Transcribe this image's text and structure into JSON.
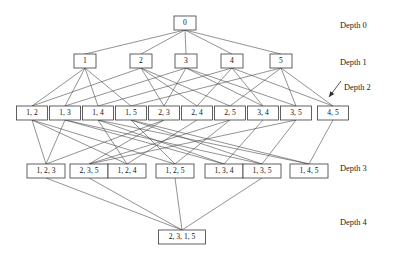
{
  "figure": {
    "type": "lattice-graph",
    "title": "",
    "background_color": "#ffffff",
    "node_fill": "#ffffff",
    "node_stroke": "#3a3a3a",
    "edge_color": "#4a4a4a"
  },
  "depth_labels": [
    {
      "text": "Depth 0",
      "x": 340,
      "y": 26
    },
    {
      "text": "Depth 1",
      "x": 340,
      "y": 63
    },
    {
      "text": "Depth 2",
      "x": 344,
      "y": 88
    },
    {
      "text": "Depth 3",
      "x": 340,
      "y": 169
    },
    {
      "text": "Depth 4",
      "x": 340,
      "y": 223
    }
  ],
  "pointer_arrow": {
    "name": "depth-2-pointer-arrow",
    "from_x": 341,
    "from_y": 81,
    "to_x": 329,
    "to_y": 97
  },
  "levels": [
    {
      "depth": 0,
      "y": 23,
      "nodes": [
        {
          "id": "n0",
          "label": "0",
          "x": 185,
          "w": 22
        }
      ]
    },
    {
      "depth": 1,
      "y": 61,
      "nodes": [
        {
          "id": "n1",
          "label": "1",
          "x": 85,
          "w": 22
        },
        {
          "id": "n2",
          "label": "2",
          "x": 141,
          "w": 22
        },
        {
          "id": "n3",
          "label": "3",
          "x": 186,
          "w": 22
        },
        {
          "id": "n4",
          "label": "4",
          "x": 232,
          "w": 22
        },
        {
          "id": "n5",
          "label": "5",
          "x": 281,
          "w": 22
        }
      ]
    },
    {
      "depth": 2,
      "y": 113,
      "nodes": [
        {
          "id": "n12",
          "label": "1, 2",
          "x": 32,
          "w": 31
        },
        {
          "id": "n13",
          "label": "1, 3",
          "x": 65,
          "w": 31
        },
        {
          "id": "n14",
          "label": "1, 4",
          "x": 98,
          "w": 31
        },
        {
          "id": "n15",
          "label": "1, 5",
          "x": 131,
          "w": 31
        },
        {
          "id": "n23",
          "label": "2, 3",
          "x": 164,
          "w": 31
        },
        {
          "id": "n24",
          "label": "2, 4",
          "x": 197,
          "w": 31
        },
        {
          "id": "n25",
          "label": "2, 5",
          "x": 230,
          "w": 31
        },
        {
          "id": "n34",
          "label": "3, 4",
          "x": 263,
          "w": 31
        },
        {
          "id": "n35",
          "label": "3, 5",
          "x": 296,
          "w": 31
        },
        {
          "id": "n45",
          "label": "4, 5",
          "x": 333,
          "w": 31
        }
      ]
    },
    {
      "depth": 3,
      "y": 171,
      "nodes": [
        {
          "id": "n123",
          "label": "1, 2, 3",
          "x": 46,
          "w": 38
        },
        {
          "id": "n235",
          "label": "2, 3, 5",
          "x": 89,
          "w": 38
        },
        {
          "id": "n124",
          "label": "1, 2, 4",
          "x": 127,
          "w": 38
        },
        {
          "id": "n125",
          "label": "1, 2, 5",
          "x": 175,
          "w": 38
        },
        {
          "id": "n134",
          "label": "1, 3, 4",
          "x": 224,
          "w": 38
        },
        {
          "id": "n135",
          "label": "1, 3, 5",
          "x": 262,
          "w": 38
        },
        {
          "id": "n145",
          "label": "1, 4, 5",
          "x": 309,
          "w": 38
        }
      ]
    },
    {
      "depth": 4,
      "y": 237,
      "nodes": [
        {
          "id": "n2315",
          "label": "2, 3, 1, 5",
          "x": 182,
          "w": 47
        }
      ]
    }
  ],
  "edges": [
    {
      "from": "n0",
      "to": "n1"
    },
    {
      "from": "n0",
      "to": "n2"
    },
    {
      "from": "n0",
      "to": "n3"
    },
    {
      "from": "n0",
      "to": "n4"
    },
    {
      "from": "n0",
      "to": "n5"
    },
    {
      "from": "n1",
      "to": "n12"
    },
    {
      "from": "n1",
      "to": "n13"
    },
    {
      "from": "n1",
      "to": "n14"
    },
    {
      "from": "n1",
      "to": "n15"
    },
    {
      "from": "n2",
      "to": "n12"
    },
    {
      "from": "n2",
      "to": "n23"
    },
    {
      "from": "n2",
      "to": "n24"
    },
    {
      "from": "n2",
      "to": "n25"
    },
    {
      "from": "n3",
      "to": "n13"
    },
    {
      "from": "n3",
      "to": "n23"
    },
    {
      "from": "n3",
      "to": "n34"
    },
    {
      "from": "n3",
      "to": "n35"
    },
    {
      "from": "n4",
      "to": "n14"
    },
    {
      "from": "n4",
      "to": "n24"
    },
    {
      "from": "n4",
      "to": "n34"
    },
    {
      "from": "n4",
      "to": "n45"
    },
    {
      "from": "n5",
      "to": "n15"
    },
    {
      "from": "n5",
      "to": "n25"
    },
    {
      "from": "n5",
      "to": "n35"
    },
    {
      "from": "n5",
      "to": "n45"
    },
    {
      "from": "n12",
      "to": "n123"
    },
    {
      "from": "n12",
      "to": "n124"
    },
    {
      "from": "n12",
      "to": "n125"
    },
    {
      "from": "n13",
      "to": "n123"
    },
    {
      "from": "n13",
      "to": "n134"
    },
    {
      "from": "n13",
      "to": "n135"
    },
    {
      "from": "n14",
      "to": "n124"
    },
    {
      "from": "n14",
      "to": "n134"
    },
    {
      "from": "n14",
      "to": "n145"
    },
    {
      "from": "n15",
      "to": "n125"
    },
    {
      "from": "n15",
      "to": "n135"
    },
    {
      "from": "n15",
      "to": "n145"
    },
    {
      "from": "n23",
      "to": "n123"
    },
    {
      "from": "n23",
      "to": "n235"
    },
    {
      "from": "n24",
      "to": "n124"
    },
    {
      "from": "n25",
      "to": "n125"
    },
    {
      "from": "n25",
      "to": "n235"
    },
    {
      "from": "n34",
      "to": "n134"
    },
    {
      "from": "n35",
      "to": "n135"
    },
    {
      "from": "n35",
      "to": "n235"
    },
    {
      "from": "n45",
      "to": "n145"
    },
    {
      "from": "n123",
      "to": "n2315"
    },
    {
      "from": "n235",
      "to": "n2315"
    },
    {
      "from": "n125",
      "to": "n2315"
    },
    {
      "from": "n135",
      "to": "n2315"
    }
  ]
}
